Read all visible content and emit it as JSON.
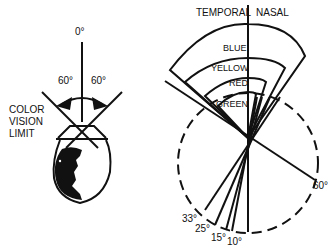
{
  "left_diagram": {
    "top_angle": "0°",
    "left_angle": "60°",
    "right_angle": "60°",
    "side_label": [
      "COLOR",
      "VISION",
      "LIMIT"
    ]
  },
  "right_diagram": {
    "header_left": "TEMPORAL",
    "header_right": "NASAL",
    "fields": [
      "BLUE",
      "YELLOW",
      "RED",
      "GREEN"
    ],
    "angles": [
      "60°",
      "33°",
      "25°",
      "15°",
      "10°"
    ]
  },
  "colors": {
    "ink": "#111111",
    "background": "#ffffff"
  }
}
